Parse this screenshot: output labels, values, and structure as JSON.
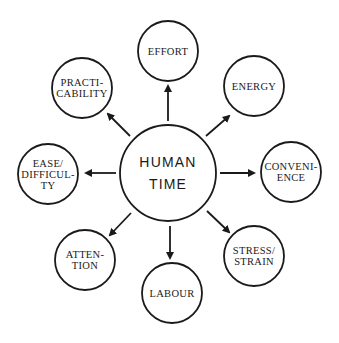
{
  "diagram": {
    "stroke_color": "#1a1a1a",
    "background": "#ffffff",
    "center": {
      "id": "human-time",
      "lines": [
        "HUMAN",
        "TIME"
      ],
      "cx": 168,
      "cy": 173,
      "r": 48
    },
    "nodes": [
      {
        "id": "effort",
        "lines": [
          "EFFORT"
        ],
        "cx": 168,
        "cy": 51,
        "r": 30
      },
      {
        "id": "energy",
        "lines": [
          "ENERGY"
        ],
        "cx": 254,
        "cy": 86,
        "r": 30
      },
      {
        "id": "convenience",
        "lines": [
          "CONVENI-",
          "ENCE"
        ],
        "cx": 291,
        "cy": 172,
        "r": 30
      },
      {
        "id": "stress-strain",
        "lines": [
          "STRESS/",
          "STRAIN"
        ],
        "cx": 254,
        "cy": 256,
        "r": 30
      },
      {
        "id": "labour",
        "lines": [
          "LABOUR"
        ],
        "cx": 172,
        "cy": 293,
        "r": 30
      },
      {
        "id": "attention",
        "lines": [
          "ATTEN-",
          "TION"
        ],
        "cx": 85,
        "cy": 260,
        "r": 30
      },
      {
        "id": "ease-difficulty",
        "lines": [
          "EASE/",
          "DIFFICUL-",
          "TY"
        ],
        "cx": 48,
        "cy": 174,
        "r": 30
      },
      {
        "id": "practicability",
        "lines": [
          "PRACTI-",
          "CABILITY"
        ],
        "cx": 82,
        "cy": 88,
        "r": 30
      }
    ],
    "arrows": [
      {
        "to": "effort",
        "x1": 168,
        "y1": 121,
        "x2": 168,
        "y2": 86
      },
      {
        "to": "energy",
        "x1": 206,
        "y1": 136,
        "x2": 229,
        "y2": 116
      },
      {
        "to": "convenience",
        "x1": 220,
        "y1": 173,
        "x2": 254,
        "y2": 173
      },
      {
        "to": "stress-strain",
        "x1": 207,
        "y1": 211,
        "x2": 229,
        "y2": 232
      },
      {
        "to": "labour",
        "x1": 170,
        "y1": 226,
        "x2": 170,
        "y2": 258
      },
      {
        "to": "attention",
        "x1": 131,
        "y1": 213,
        "x2": 110,
        "y2": 235
      },
      {
        "to": "ease-difficulty",
        "x1": 116,
        "y1": 173,
        "x2": 86,
        "y2": 173
      },
      {
        "to": "practicability",
        "x1": 130,
        "y1": 136,
        "x2": 108,
        "y2": 114
      }
    ]
  }
}
